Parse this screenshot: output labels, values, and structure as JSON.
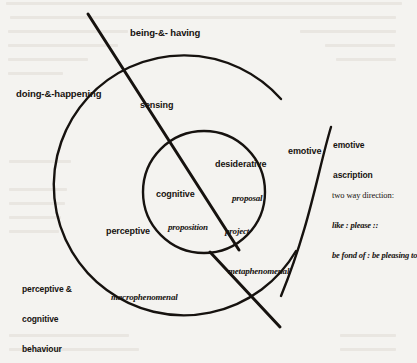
{
  "figure": {
    "kind": "venn-like concentric circle diagram with diagonal dividing lines",
    "colors": {
      "ink": "#16120f",
      "paper": "#f4f3f0",
      "ghost_text": "#ded9d2"
    },
    "geometry": {
      "outer_circle": {
        "cx": 200,
        "cy": 190,
        "r": 130,
        "note": "open arc, gap at upper right"
      },
      "inner_circle": {
        "cx": 204,
        "cy": 192,
        "r": 61
      },
      "right_arc": {
        "note": "large arc sweeping down the right side, outside the outer circle"
      },
      "diagonal_upper": {
        "x1": 88,
        "y1": 14,
        "x2": 238,
        "y2": 248,
        "note": "long diagonal from top-left through sensing to project"
      },
      "diagonal_lower": {
        "x1": 212,
        "y1": 253,
        "x2": 278,
        "y2": 325,
        "note": "short diagonal crossing metaphenomenal region"
      }
    },
    "labels": {
      "being_and_having": "being-&- having",
      "doing_and_happening": "doing-&-happening",
      "sensing": "sensing",
      "desiderative": "desiderative",
      "proposal": "proposal",
      "cognitive": "cognitive",
      "proposition": "proposition",
      "project": "project",
      "perceptive": "perceptive",
      "emotive": "emotive",
      "emotive_ascription_line1": "emotive",
      "emotive_ascription_line2": "ascription",
      "two_way_direction_heading": "two way direction:",
      "two_way_direction_line1": "like : please ::",
      "two_way_direction_line2": "be fond of : be pleasing to",
      "perceptive_cognitive_behaviour_line1": "perceptive &",
      "perceptive_cognitive_behaviour_line2": "cognitive",
      "perceptive_cognitive_behaviour_line3": "behaviour",
      "macrophenomenal": "macrophenomenal",
      "metaphenomenal": "metaphenomenal"
    }
  }
}
